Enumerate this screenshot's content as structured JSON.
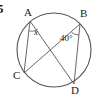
{
  "figure": {
    "question_number": "5",
    "type": "circle-geometry-diagram",
    "stroke_color": "#55555a",
    "text_color": "#1a1a1a",
    "background_color": "#ffffff",
    "circle": {
      "center_x": 54,
      "center_y": 50,
      "radius": 37
    },
    "points": [
      {
        "id": "A",
        "label": "A",
        "x": 30,
        "y": 21
      },
      {
        "id": "B",
        "label": "B",
        "x": 80,
        "y": 24
      },
      {
        "id": "C",
        "label": "C",
        "x": 24,
        "y": 73
      },
      {
        "id": "D",
        "label": "D",
        "x": 74,
        "y": 84
      }
    ],
    "chords": [
      {
        "id": "AC",
        "from": "A",
        "to": "C"
      },
      {
        "id": "AD",
        "from": "A",
        "to": "D"
      },
      {
        "id": "BC",
        "from": "B",
        "to": "C"
      },
      {
        "id": "BD",
        "from": "B",
        "to": "D"
      }
    ],
    "angles": [
      {
        "id": "angle-x",
        "vertex": "A",
        "label": "x",
        "description": "angle CAD at vertex A, unknown"
      },
      {
        "id": "angle-40",
        "vertex": "B",
        "label": "40°",
        "description": "angle CBD at vertex B, 40 degrees"
      }
    ]
  }
}
